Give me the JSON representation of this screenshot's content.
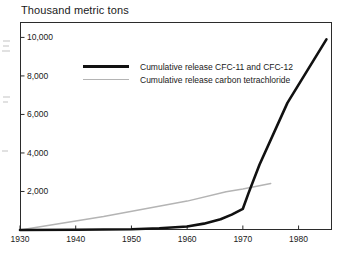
{
  "chart_data": {
    "type": "line",
    "title": "Thousand metric tons",
    "xlabel": "",
    "ylabel": "",
    "xlim": [
      1930,
      1986
    ],
    "ylim": [
      0,
      10800
    ],
    "grid": false,
    "legend_position": "inside-upper-center",
    "xticks": [
      "1930",
      "1940",
      "1950",
      "1960",
      "1970",
      "1980"
    ],
    "xtick_values": [
      1930,
      1940,
      1950,
      1960,
      1970,
      1980
    ],
    "yticks": [
      "2,000",
      "4,000",
      "6,000",
      "8,000",
      "10,000"
    ],
    "ytick_values": [
      2000,
      4000,
      6000,
      8000,
      10000
    ],
    "series": [
      {
        "name": "Cumulative release CFC-11 and CFC-12",
        "color": "#111111",
        "width": "thick",
        "x": [
          1930,
          1940,
          1950,
          1955,
          1960,
          1963,
          1966,
          1968,
          1970,
          1971,
          1973,
          1978,
          1985
        ],
        "values": [
          0,
          10,
          40,
          90,
          180,
          330,
          560,
          800,
          1100,
          1900,
          3400,
          6600,
          9900
        ]
      },
      {
        "name": "Cumulative release carbon tetrachloride",
        "color": "#b4b4b4",
        "width": "thin",
        "x": [
          1930,
          1945,
          1960,
          1967,
          1970,
          1975
        ],
        "values": [
          0,
          700,
          1500,
          1990,
          2130,
          2420
        ]
      }
    ]
  },
  "legend": {
    "items": [
      {
        "label": "Cumulative release CFC-11 and CFC-12"
      },
      {
        "label": "Cumulative release carbon tetrachloride"
      }
    ]
  }
}
